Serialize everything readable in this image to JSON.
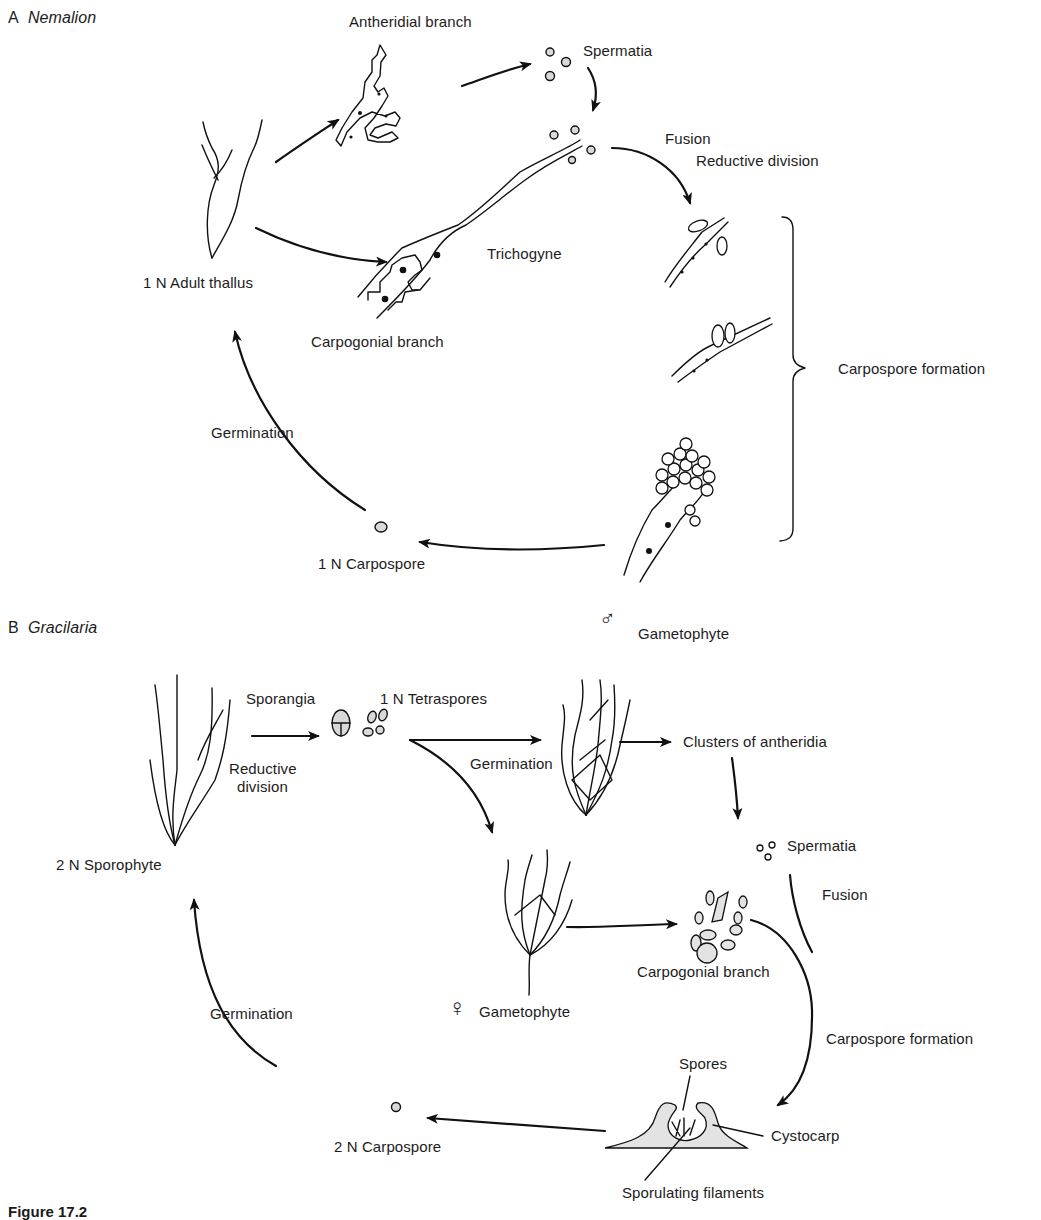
{
  "figure": {
    "caption_partial": "Figure 17.2",
    "panels": [
      {
        "id": "A",
        "letter": "A",
        "genus": "Nemalion",
        "labels": {
          "antheridial_branch": "Antheridial branch",
          "spermatia": "Spermatia",
          "fusion": "Fusion",
          "reductive_division": "Reductive division",
          "trichogyne": "Trichogyne",
          "adult_thallus": "1 N Adult thallus",
          "carpogonial_branch": "Carpogonial branch",
          "carpospore_formation": "Carpospore formation",
          "germination": "Germination",
          "carpospore": "1 N Carpospore"
        }
      },
      {
        "id": "B",
        "letter": "B",
        "genus": "Gracilaria",
        "labels": {
          "male_symbol": "♂",
          "male_gametophyte": "Gametophyte",
          "sporangia": "Sporangia",
          "tetraspores": "1 N Tetraspores",
          "reductive_division_line1": "Reductive",
          "reductive_division_line2": "division",
          "germination_top": "Germination",
          "clusters_of_antheridia": "Clusters of antheridia",
          "spermatia": "Spermatia",
          "sporophyte": "2 N Sporophyte",
          "fusion": "Fusion",
          "carpogonial_branch": "Carpogonial branch",
          "female_symbol": "♀",
          "female_gametophyte": "Gametophyte",
          "germination_left": "Germination",
          "carpospore_formation": "Carpospore formation",
          "spores": "Spores",
          "cystocarp": "Cystocarp",
          "carpospore": "2 N Carpospore",
          "sporulating_filaments": "Sporulating filaments"
        }
      }
    ]
  }
}
